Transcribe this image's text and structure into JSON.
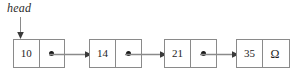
{
  "diagram": {
    "type": "singly-linked-list",
    "head_label": "head",
    "null_symbol": "Ω",
    "stroke_color": "#8a8a8a",
    "text_color": "#1e1e1e",
    "background": "#ffffff",
    "nodes": [
      {
        "value": "10",
        "pointer": "arrow"
      },
      {
        "value": "14",
        "pointer": "arrow"
      },
      {
        "value": "21",
        "pointer": "arrow"
      },
      {
        "value": "35",
        "pointer": "null"
      }
    ],
    "links": [
      {
        "from": "10",
        "to": "14"
      },
      {
        "from": "14",
        "to": "21"
      },
      {
        "from": "21",
        "to": "35"
      }
    ]
  }
}
